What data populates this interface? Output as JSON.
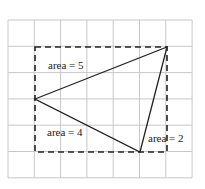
{
  "grid": {
    "cols": 7,
    "rows": 6,
    "x0": 8,
    "y0": 20,
    "cell": 26.3,
    "color": "#c8c8c8"
  },
  "rectangle": {
    "x1": 35,
    "y1": 47,
    "x2": 167,
    "y2": 152,
    "style": "dashed"
  },
  "triangle": {
    "points": [
      [
        35,
        99
      ],
      [
        167,
        47
      ],
      [
        140,
        152
      ]
    ]
  },
  "labels": [
    {
      "text": "area = 5",
      "x": 48,
      "y": 69
    },
    {
      "text": "area = 4",
      "x": 47,
      "y": 136
    },
    {
      "text": "area = 2",
      "x": 148,
      "y": 142
    }
  ]
}
